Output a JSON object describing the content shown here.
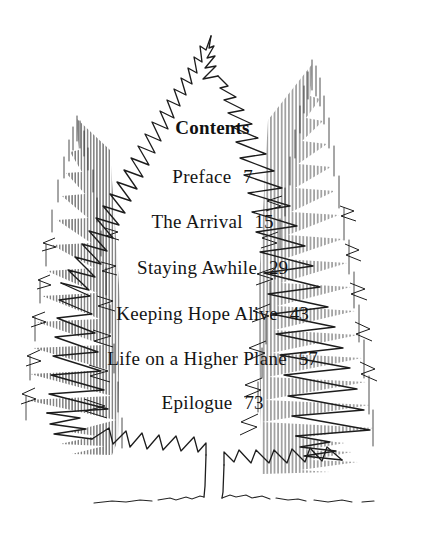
{
  "page": {
    "width": 425,
    "height": 542,
    "background_color": "#ffffff",
    "ink_color": "#1a1a1a",
    "kind": "book-table-of-contents-page"
  },
  "illustration": {
    "name": "three-evergreen-trees-pen-and-ink",
    "description": "Pen and ink line drawing of three conifer trees; a large central fir rendered as a jagged zigzag outline, flanked by two taller spruces rendered with dense vertical hatching, with a slender bare trunk and a wavy ground line below.",
    "elements": [
      "center-fir-outline",
      "left-spruce-hatched",
      "right-spruce-hatched",
      "tree-trunk",
      "ground-line"
    ]
  },
  "contents": {
    "heading": "Contents",
    "entries": [
      {
        "title": "Preface",
        "page": "7"
      },
      {
        "title": "The Arrival",
        "page": "15"
      },
      {
        "title": "Staying Awhile",
        "page": "29"
      },
      {
        "title": "Keeping Hope Alive",
        "page": "43"
      },
      {
        "title": "Life on a Higher Plane",
        "page": "57"
      },
      {
        "title": "Epilogue",
        "page": "73"
      }
    ]
  }
}
